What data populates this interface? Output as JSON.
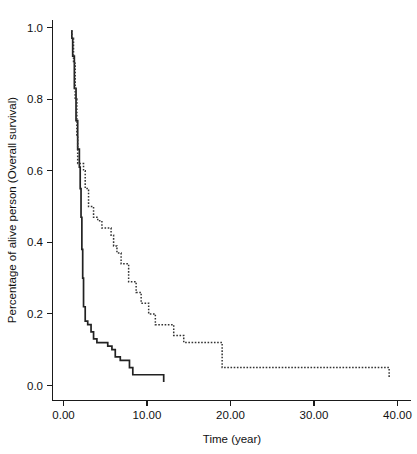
{
  "chart_data": {
    "type": "line",
    "title": "",
    "subtitle": "",
    "xlabel": "Time (year)",
    "ylabel": "Percentage of alive person (Overall survival)",
    "xlim": [
      0,
      41.5
    ],
    "ylim": [
      0.0,
      1.04
    ],
    "grid": false,
    "legend": "none",
    "xticks": [
      0,
      10,
      20,
      30,
      40
    ],
    "xtick_labels": [
      "0.00",
      "10.00",
      "20.00",
      "30.00",
      "40.00"
    ],
    "yticks": [
      0.0,
      0.2,
      0.4,
      0.6,
      0.8,
      1.0
    ],
    "ytick_labels": [
      "0.0",
      "0.2",
      "0.4",
      "0.6",
      "0.8",
      "1.0"
    ],
    "series": [
      {
        "name": "solid-survival-curve",
        "style": "solid",
        "color": "#222222",
        "step": true,
        "x": [
          0.9,
          1.0,
          1.1,
          1.3,
          1.5,
          1.7,
          1.9,
          2.0,
          2.1,
          2.2,
          2.3,
          2.4,
          2.6,
          2.9,
          3.3,
          3.6,
          4.0,
          4.6,
          5.3,
          5.8,
          6.2,
          6.8,
          7.4,
          7.9,
          8.3,
          11.9,
          12.0
        ],
        "y": [
          0.99,
          0.97,
          0.92,
          0.83,
          0.74,
          0.66,
          0.61,
          0.55,
          0.47,
          0.38,
          0.3,
          0.22,
          0.18,
          0.17,
          0.15,
          0.13,
          0.12,
          0.12,
          0.11,
          0.1,
          0.08,
          0.07,
          0.07,
          0.05,
          0.03,
          0.03,
          0.01
        ]
      },
      {
        "name": "dotted-survival-curve",
        "style": "dotted",
        "color": "#333333",
        "step": true,
        "x": [
          0.9,
          1.0,
          1.2,
          1.4,
          1.6,
          1.7,
          2.1,
          2.4,
          2.6,
          3.0,
          3.6,
          4.1,
          4.6,
          5.2,
          5.7,
          6.0,
          6.4,
          6.9,
          7.3,
          7.8,
          8.2,
          8.7,
          9.3,
          10.2,
          11.0,
          12.1,
          13.2,
          14.4,
          18.8,
          19.0,
          38.9,
          39.0
        ],
        "y": [
          0.99,
          0.97,
          0.9,
          0.8,
          0.7,
          0.62,
          0.62,
          0.6,
          0.55,
          0.5,
          0.47,
          0.46,
          0.44,
          0.44,
          0.42,
          0.39,
          0.37,
          0.34,
          0.34,
          0.29,
          0.29,
          0.26,
          0.23,
          0.2,
          0.17,
          0.17,
          0.14,
          0.12,
          0.12,
          0.05,
          0.05,
          0.02
        ]
      }
    ]
  },
  "axes": {
    "x_title": "Time (year)",
    "y_title": "Percentage of alive person (Overall survival)",
    "x_tick_labels": [
      "0.00",
      "10.00",
      "20.00",
      "30.00",
      "40.00"
    ],
    "y_tick_labels": [
      "1.0",
      "0.8",
      "0.6",
      "0.4",
      "0.2",
      "0.0"
    ]
  },
  "colors": {
    "axis": "#1a1a1a",
    "solid_curve": "#222222",
    "dotted_curve": "#333333",
    "background": "#ffffff"
  }
}
